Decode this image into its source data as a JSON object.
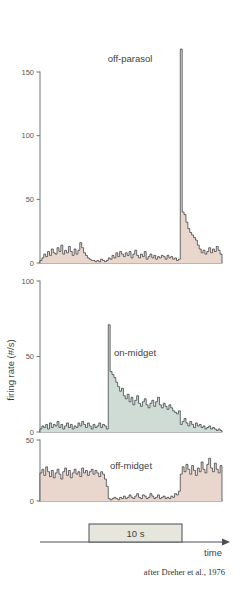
{
  "figure": {
    "credit": "after Dreher et al., 1976",
    "y_axis_title": "firing rate (#/s)",
    "time_axis_label": "time",
    "stimulus_label": "10 s",
    "colors": {
      "off_fill": "#e9d7ce",
      "on_fill": "#cfdcd6",
      "outline": "#2b2e31",
      "axis": "#6f7479",
      "stimulus_bar_fill": "#e6e6dc",
      "text": "#3b3f44"
    }
  },
  "chart_data": [
    {
      "type": "bar",
      "title": "off-parasol",
      "xlabel": "time",
      "ylabel": "firing rate (#/s)",
      "ylim": [
        0,
        170
      ],
      "yticks": [
        0,
        50,
        100,
        150
      ],
      "grid": false,
      "legend": "none",
      "fill_color": "#e9d7ce",
      "stimulus_onset_bin": 36,
      "stimulus_offset_bin": 74,
      "bin_count": 96,
      "values": [
        2,
        4,
        7,
        5,
        9,
        6,
        11,
        8,
        7,
        12,
        9,
        14,
        7,
        10,
        8,
        13,
        9,
        6,
        11,
        7,
        10,
        16,
        12,
        8,
        6,
        4,
        3,
        2,
        2,
        1,
        2,
        1,
        3,
        2,
        1,
        2,
        4,
        3,
        6,
        4,
        8,
        5,
        9,
        7,
        5,
        8,
        6,
        9,
        4,
        7,
        10,
        6,
        4,
        7,
        5,
        9,
        3,
        5,
        7,
        4,
        6,
        3,
        5,
        4,
        6,
        5,
        3,
        6,
        4,
        5,
        3,
        4,
        2,
        3,
        168,
        40,
        38,
        32,
        27,
        24,
        22,
        20,
        18,
        14,
        11,
        8,
        10,
        7,
        9,
        12,
        8,
        11,
        9,
        13,
        10,
        7
      ]
    },
    {
      "type": "bar",
      "title": "on-midget",
      "xlabel": "time",
      "ylabel": "firing rate (#/s)",
      "ylim": [
        0,
        100
      ],
      "yticks": [
        0,
        50,
        100
      ],
      "grid": false,
      "legend": "none",
      "fill_color": "#cfdcd6",
      "stimulus_onset_bin": 36,
      "stimulus_offset_bin": 74,
      "bin_count": 96,
      "values": [
        2,
        4,
        3,
        5,
        2,
        6,
        3,
        5,
        4,
        7,
        3,
        5,
        2,
        4,
        6,
        3,
        5,
        2,
        4,
        3,
        6,
        4,
        7,
        5,
        3,
        6,
        4,
        2,
        5,
        3,
        4,
        6,
        3,
        5,
        4,
        2,
        71,
        40,
        38,
        36,
        33,
        30,
        27,
        29,
        24,
        22,
        25,
        20,
        23,
        18,
        21,
        24,
        19,
        17,
        20,
        22,
        18,
        16,
        19,
        21,
        17,
        20,
        23,
        18,
        16,
        19,
        17,
        15,
        18,
        16,
        14,
        13,
        12,
        14,
        5,
        7,
        9,
        6,
        4,
        7,
        5,
        3,
        6,
        4,
        5,
        3,
        4,
        2,
        3,
        4,
        2,
        3,
        2,
        1,
        2,
        1
      ]
    },
    {
      "type": "bar",
      "title": "off-midget",
      "xlabel": "time",
      "ylabel": "firing rate (#/s)",
      "ylim": [
        0,
        50
      ],
      "yticks": [
        0,
        50
      ],
      "grid": false,
      "legend": "none",
      "fill_color": "#e9d7ce",
      "stimulus_onset_bin": 36,
      "stimulus_offset_bin": 74,
      "bin_count": 96,
      "values": [
        23,
        26,
        21,
        28,
        24,
        20,
        25,
        19,
        23,
        26,
        22,
        18,
        24,
        27,
        21,
        25,
        19,
        23,
        26,
        22,
        24,
        20,
        27,
        23,
        25,
        21,
        24,
        26,
        22,
        25,
        23,
        20,
        24,
        22,
        18,
        12,
        2,
        1,
        2,
        3,
        2,
        1,
        3,
        2,
        4,
        2,
        3,
        5,
        3,
        2,
        4,
        6,
        3,
        2,
        5,
        4,
        2,
        3,
        6,
        4,
        2,
        3,
        5,
        2,
        3,
        4,
        2,
        3,
        2,
        4,
        3,
        6,
        5,
        8,
        22,
        28,
        24,
        30,
        26,
        22,
        29,
        25,
        21,
        27,
        24,
        32,
        26,
        23,
        30,
        35,
        27,
        24,
        31,
        26,
        23,
        29
      ]
    }
  ]
}
